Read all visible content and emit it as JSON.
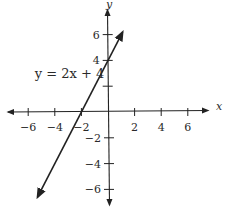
{
  "chart_data": {
    "type": "line",
    "title": "",
    "xlabel": "x",
    "ylabel": "y",
    "xlim": [
      -7.5,
      7.5
    ],
    "ylim": [
      -7.5,
      7.5
    ],
    "grid": false,
    "x_ticks": [
      -6,
      -4,
      -2,
      2,
      4,
      6
    ],
    "y_ticks": [
      -6,
      -4,
      -2,
      2,
      4,
      6
    ],
    "x_tick_labels": [
      "−6",
      "−4",
      "−2",
      "2",
      "4",
      "6"
    ],
    "y_tick_labels": [
      "−6",
      "−4",
      "−2",
      "",
      "4",
      "6"
    ],
    "series": [
      {
        "name": "y = 2x + 4",
        "slope": 2,
        "intercept": 4,
        "x": [
          -5.3,
          1.1
        ],
        "y": [
          -6.6,
          6.2
        ],
        "color": "#222222"
      }
    ],
    "annotations": [
      {
        "text": "y = 2x + 4",
        "x": -5.5,
        "y": 2.6
      }
    ]
  }
}
